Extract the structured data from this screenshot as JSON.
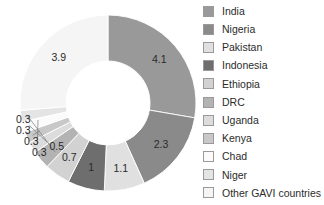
{
  "chart_data": {
    "type": "pie",
    "variant": "donut",
    "title": "",
    "subtitle": "",
    "xlabel": "",
    "ylabel": "",
    "total": 14.8,
    "units": "",
    "legend_position": "right",
    "grid": false,
    "start_angle_deg": 0,
    "direction": "clockwise",
    "categories": [
      "India",
      "Nigeria",
      "Pakistan",
      "Indonesia",
      "Ethiopia",
      "DRC",
      "Uganda",
      "Kenya",
      "Chad",
      "Niger",
      "Other GAVI countries"
    ],
    "values": [
      4.1,
      2.3,
      1.1,
      1,
      0.7,
      0.5,
      0.3,
      0.3,
      0.3,
      0.3,
      3.9
    ],
    "value_labels": [
      "4.1",
      "2.3",
      "1.1",
      "1",
      "0.7",
      "0.5",
      "0.3",
      "0.3",
      "0.3",
      "0.3",
      "3.9"
    ],
    "colors": [
      "#999999",
      "#8a8a8a",
      "#e0e0e0",
      "#6e6e6e",
      "#d2d2d2",
      "#b3b3b3",
      "#dcdcdc",
      "#c8c8c8",
      "#fbfbfb",
      "#e4e4e4",
      "#f5f5f5"
    ],
    "slices": [
      {
        "name": "India",
        "value": 4.1,
        "label": "4.1",
        "color": "#999999",
        "label_placement": "inside"
      },
      {
        "name": "Nigeria",
        "value": 2.3,
        "label": "2.3",
        "color": "#8a8a8a",
        "label_placement": "inside"
      },
      {
        "name": "Pakistan",
        "value": 1.1,
        "label": "1.1",
        "color": "#e0e0e0",
        "label_placement": "inside"
      },
      {
        "name": "Indonesia",
        "value": 1,
        "label": "1",
        "color": "#6e6e6e",
        "label_placement": "inside"
      },
      {
        "name": "Ethiopia",
        "value": 0.7,
        "label": "0.7",
        "color": "#d2d2d2",
        "label_placement": "inside"
      },
      {
        "name": "DRC",
        "value": 0.5,
        "label": "0.5",
        "color": "#b3b3b3",
        "label_placement": "inside"
      },
      {
        "name": "Uganda",
        "value": 0.3,
        "label": "0.3",
        "color": "#dcdcdc",
        "label_placement": "callout"
      },
      {
        "name": "Kenya",
        "value": 0.3,
        "label": "0.3",
        "color": "#c8c8c8",
        "label_placement": "callout"
      },
      {
        "name": "Chad",
        "value": 0.3,
        "label": "0.3",
        "color": "#fbfbfb",
        "label_placement": "callout"
      },
      {
        "name": "Niger",
        "value": 0.3,
        "label": "0.3",
        "color": "#e4e4e4",
        "label_placement": "callout"
      },
      {
        "name": "Other GAVI countries",
        "value": 3.9,
        "label": "3.9",
        "color": "#f5f5f5",
        "label_placement": "inside"
      }
    ]
  },
  "legend": {
    "items": [
      {
        "label": "India",
        "color": "#999999"
      },
      {
        "label": "Nigeria",
        "color": "#8a8a8a"
      },
      {
        "label": "Pakistan",
        "color": "#e0e0e0"
      },
      {
        "label": "Indonesia",
        "color": "#6e6e6e"
      },
      {
        "label": "Ethiopia",
        "color": "#d2d2d2"
      },
      {
        "label": "DRC",
        "color": "#b3b3b3"
      },
      {
        "label": "Uganda",
        "color": "#dcdcdc"
      },
      {
        "label": "Kenya",
        "color": "#c8c8c8"
      },
      {
        "label": "Chad",
        "color": "#fbfbfb"
      },
      {
        "label": "Niger",
        "color": "#e4e4e4"
      },
      {
        "label": "Other GAVI countries",
        "color": "#f5f5f5"
      }
    ]
  }
}
